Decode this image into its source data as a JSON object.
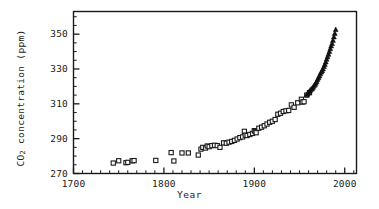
{
  "chart_data": {
    "type": "scatter",
    "title": "",
    "xlabel": "Year",
    "ylabel": "CO2 concentration (ppm)",
    "ylabel_parts": {
      "pre": "CO",
      "sub": "2",
      "post": " concentration (ppm)"
    },
    "xlim": [
      1700,
      2013
    ],
    "ylim": [
      270,
      363
    ],
    "grid": false,
    "legend": "none",
    "xticks": [
      1700,
      1800,
      1900,
      2000
    ],
    "xtick_labels": [
      "1700",
      "1800",
      "1900",
      "2000"
    ],
    "xminor_step": 10,
    "yticks": [
      270,
      290,
      310,
      330,
      350
    ],
    "ytick_labels": [
      "270",
      "290",
      "310",
      "330",
      "350"
    ],
    "yminor_step": 5,
    "series": [
      {
        "name": "ice-core",
        "marker": "open-square",
        "color": "#1a1a1a",
        "points": [
          [
            1744,
            276.0
          ],
          [
            1750,
            277.3
          ],
          [
            1758,
            276.2
          ],
          [
            1760,
            276.4
          ],
          [
            1765,
            277.3
          ],
          [
            1767,
            277.4
          ],
          [
            1791,
            277.5
          ],
          [
            1808,
            282.0
          ],
          [
            1811,
            277.2
          ],
          [
            1820,
            281.8
          ],
          [
            1827,
            281.8
          ],
          [
            1838,
            280.6
          ],
          [
            1841,
            284.0
          ],
          [
            1843,
            285.0
          ],
          [
            1846,
            284.6
          ],
          [
            1848,
            285.8
          ],
          [
            1850,
            285.4
          ],
          [
            1853,
            286.0
          ],
          [
            1856,
            286.2
          ],
          [
            1859,
            286.0
          ],
          [
            1862,
            285.0
          ],
          [
            1866,
            287.6
          ],
          [
            1869,
            287.4
          ],
          [
            1872,
            288.0
          ],
          [
            1875,
            288.4
          ],
          [
            1878,
            289.0
          ],
          [
            1881,
            289.8
          ],
          [
            1884,
            290.6
          ],
          [
            1887,
            291.0
          ],
          [
            1889,
            294.2
          ],
          [
            1890,
            292.0
          ],
          [
            1892,
            291.8
          ],
          [
            1895,
            292.4
          ],
          [
            1898,
            293.0
          ],
          [
            1900,
            294.6
          ],
          [
            1901,
            294.0
          ],
          [
            1902,
            293.4
          ],
          [
            1905,
            296.0
          ],
          [
            1908,
            296.6
          ],
          [
            1911,
            297.4
          ],
          [
            1914,
            298.4
          ],
          [
            1917,
            299.4
          ],
          [
            1920,
            300.0
          ],
          [
            1923,
            301.0
          ],
          [
            1926,
            304.0
          ],
          [
            1929,
            304.6
          ],
          [
            1932,
            305.6
          ],
          [
            1935,
            306.0
          ],
          [
            1938,
            306.2
          ],
          [
            1941,
            309.4
          ],
          [
            1944,
            308.0
          ],
          [
            1948,
            310.6
          ],
          [
            1952,
            312.6
          ],
          [
            1953,
            311.0
          ],
          [
            1955,
            311.2
          ],
          [
            1958,
            315.0
          ],
          [
            1961,
            316.4
          ]
        ]
      },
      {
        "name": "mauna-loa",
        "marker": "filled-triangle",
        "color": "#111111",
        "points": [
          [
            1958,
            315.2
          ],
          [
            1959,
            315.8
          ],
          [
            1960,
            316.6
          ],
          [
            1961,
            317.2
          ],
          [
            1962,
            317.8
          ],
          [
            1963,
            318.4
          ],
          [
            1964,
            318.8
          ],
          [
            1965,
            319.5
          ],
          [
            1966,
            320.3
          ],
          [
            1967,
            321.0
          ],
          [
            1968,
            321.8
          ],
          [
            1969,
            322.8
          ],
          [
            1970,
            324.0
          ],
          [
            1971,
            325.0
          ],
          [
            1972,
            326.0
          ],
          [
            1973,
            327.2
          ],
          [
            1974,
            328.2
          ],
          [
            1975,
            329.0
          ],
          [
            1976,
            330.0
          ],
          [
            1977,
            331.4
          ],
          [
            1978,
            332.6
          ],
          [
            1979,
            334.0
          ],
          [
            1980,
            335.6
          ],
          [
            1981,
            337.0
          ],
          [
            1982,
            338.4
          ],
          [
            1983,
            340.0
          ],
          [
            1984,
            341.6
          ],
          [
            1985,
            343.2
          ],
          [
            1986,
            344.6
          ],
          [
            1987,
            346.4
          ],
          [
            1988,
            348.4
          ],
          [
            1989,
            350.4
          ],
          [
            1990,
            352.6
          ]
        ]
      }
    ]
  },
  "axis": {
    "frame_color": "#1a1a1a"
  }
}
